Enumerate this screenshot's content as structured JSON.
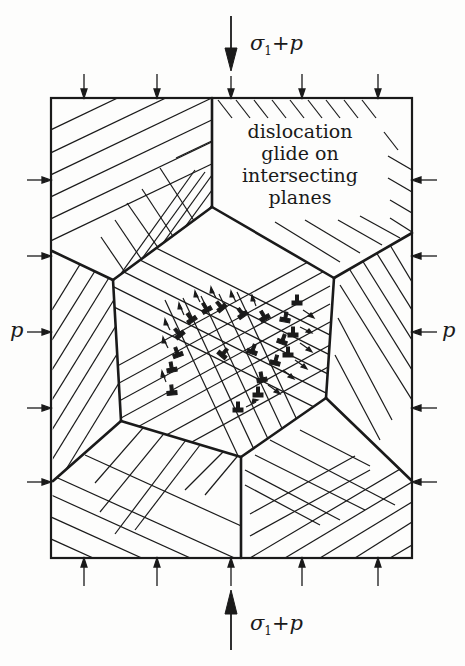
{
  "figure": {
    "annotation_lines": [
      "dislocation",
      "glide on",
      "intersecting",
      "planes"
    ],
    "top_load_label": {
      "sigma": "σ",
      "sub": "1",
      "rest": "+p"
    },
    "bottom_load_label": {
      "sigma": "σ",
      "sub": "1",
      "rest": "+p"
    },
    "left_pressure_label": "p",
    "right_pressure_label": "p",
    "colors": {
      "ink": "#1a1a1a",
      "background": "#fdfdfc"
    }
  },
  "geometry": {
    "box": {
      "x1": 51,
      "y1": 98,
      "x2": 412,
      "y2": 558
    },
    "grain_boundaries": [
      [
        [
          212,
          98
        ],
        [
          212,
          207
        ]
      ],
      [
        [
          52,
          251
        ],
        [
          113,
          280
        ]
      ],
      [
        [
          113,
          280
        ],
        [
          212,
          207
        ]
      ],
      [
        [
          212,
          207
        ],
        [
          334,
          278
        ]
      ],
      [
        [
          334,
          278
        ],
        [
          412,
          233
        ]
      ],
      [
        [
          113,
          280
        ],
        [
          121,
          421
        ]
      ],
      [
        [
          334,
          278
        ],
        [
          326,
          398
        ]
      ],
      [
        [
          121,
          421
        ],
        [
          53,
          481
        ]
      ],
      [
        [
          121,
          421
        ],
        [
          241,
          457
        ]
      ],
      [
        [
          241,
          457
        ],
        [
          326,
          398
        ]
      ],
      [
        [
          326,
          398
        ],
        [
          412,
          481
        ]
      ],
      [
        [
          241,
          457
        ],
        [
          241,
          558
        ]
      ]
    ],
    "top_arrows_x": [
      84,
      157,
      232,
      302,
      378
    ],
    "bottom_arrows_x": [
      84,
      157,
      232,
      302,
      378
    ],
    "left_arrows_y": [
      180,
      256,
      332,
      408,
      482
    ],
    "right_arrows_y": [
      180,
      256,
      332,
      408,
      482
    ]
  }
}
